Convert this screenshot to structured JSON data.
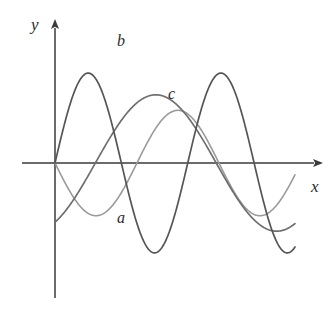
{
  "figure": {
    "title": "",
    "axes": {
      "x_label": "x",
      "y_label": "y",
      "origin_px": [
        55,
        163
      ],
      "x_axis_from_px": [
        22,
        163
      ],
      "x_axis_to_px": [
        322,
        163
      ],
      "y_axis_from_px": [
        55,
        298
      ],
      "y_axis_to_px": [
        55,
        20
      ],
      "axis_color": "#3a3a3a",
      "arrow_x": true,
      "arrow_y": true
    },
    "curve_labels": [
      {
        "id": "a",
        "text": "a",
        "color": "#9a9a9a"
      },
      {
        "id": "b",
        "text": "b",
        "color": "#555555"
      },
      {
        "id": "c",
        "text": "c",
        "color": "#6f6f6f"
      }
    ]
  },
  "chart_data": {
    "type": "line",
    "title": "",
    "xlabel": "x",
    "ylabel": "y",
    "grid": false,
    "legend": "inline-curve-labels",
    "axis_ranges": {
      "xlim": [
        0,
        8.0
      ],
      "ylim": [
        -2.2,
        2.2
      ]
    },
    "series": [
      {
        "name": "a",
        "label": "a",
        "color": "#9a9a9a",
        "stroke_width": 1.6,
        "form": "y = -0.85 * sin(x * 1.15)",
        "amplitude": 0.85,
        "period": 5.46,
        "phase": "starts at origin, goes negative first",
        "x": [
          0.0,
          0.4,
          0.8,
          1.2,
          1.6,
          2.0,
          2.4,
          2.8,
          3.2,
          3.6,
          4.0,
          4.4,
          4.8,
          5.2,
          5.6,
          6.0,
          6.4,
          6.8,
          7.2,
          7.6,
          8.0
        ],
        "y": [
          0.0,
          -0.38,
          -0.7,
          -0.85,
          -0.84,
          -0.66,
          -0.36,
          0.0,
          0.36,
          0.66,
          0.84,
          0.85,
          0.7,
          0.4,
          0.04,
          -0.33,
          -0.64,
          -0.83,
          -0.85,
          -0.72,
          -0.45
        ]
      },
      {
        "name": "b",
        "label": "b",
        "color": "#555555",
        "stroke_width": 1.7,
        "form": "y = 1.45 * sin(x * 1.42)",
        "amplitude": 1.45,
        "period": 4.42,
        "phase": "starts at origin, rises first, largest amplitude",
        "x": [
          0.0,
          0.4,
          0.8,
          1.2,
          1.6,
          2.0,
          2.4,
          2.8,
          3.2,
          3.6,
          4.0,
          4.4,
          4.8,
          5.2,
          5.6,
          6.0,
          6.4,
          6.8,
          7.2,
          7.6,
          8.0
        ],
        "y": [
          0.0,
          0.79,
          1.26,
          1.45,
          1.3,
          0.9,
          0.3,
          -0.36,
          -0.94,
          -1.33,
          -1.45,
          -1.25,
          -0.81,
          -0.2,
          0.45,
          1.0,
          1.36,
          1.45,
          1.23,
          0.77,
          0.15
        ]
      },
      {
        "name": "c",
        "label": "c",
        "color": "#6f6f6f",
        "stroke_width": 1.7,
        "form": "y = 1.1 * sin(x * 0.78 - 1.05)",
        "amplitude": 1.1,
        "period": 8.05,
        "phase": "starts below axis at x = 0, crosses upward near x = 1.35",
        "x": [
          0.0,
          0.4,
          0.8,
          1.2,
          1.6,
          2.0,
          2.4,
          2.8,
          3.2,
          3.6,
          4.0,
          4.4,
          4.8,
          5.2,
          5.6,
          6.0,
          6.4,
          6.8,
          7.2,
          7.6,
          8.0
        ],
        "y": [
          -0.95,
          -0.8,
          -0.57,
          -0.3,
          0.0,
          0.3,
          0.58,
          0.81,
          0.98,
          1.08,
          1.1,
          1.04,
          0.9,
          0.7,
          0.45,
          0.17,
          -0.14,
          -0.43,
          -0.69,
          -0.89,
          -1.03
        ]
      }
    ]
  }
}
